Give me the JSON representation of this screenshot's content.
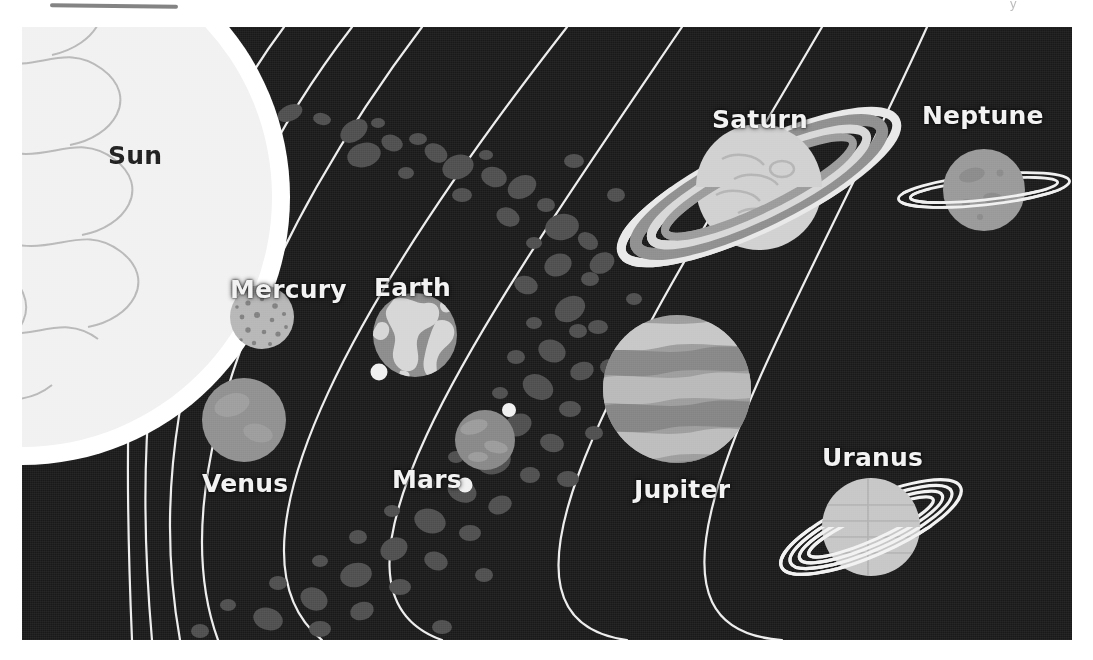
{
  "page": {
    "background_color": "#ffffff",
    "scan_artifact_text": "y"
  },
  "illustration": {
    "title": "Solar System",
    "background_color": "#191919",
    "orbit_line_color": "#ededed",
    "bounds": {
      "x": 22,
      "y": 27,
      "width": 1050,
      "height": 613
    }
  },
  "labels": {
    "sun": "Sun",
    "mercury": "Mercury",
    "venus": "Venus",
    "earth": "Earth",
    "mars": "Mars",
    "jupiter": "Jupiter",
    "saturn": "Saturn",
    "uranus": "Uranus",
    "neptune": "Neptune"
  },
  "bodies": [
    {
      "name": "sun",
      "label": "Sun",
      "order": 0,
      "kind": "star",
      "cx": 0,
      "cy": 170,
      "r": 250,
      "color": "#f0f0f0",
      "surface": "swirl-contours",
      "rings": 0,
      "moons": 0,
      "label_color": "#1d1d1d"
    },
    {
      "name": "mercury",
      "label": "Mercury",
      "order": 1,
      "kind": "planet",
      "cx": 240,
      "cy": 290,
      "r": 32,
      "color": "#b9b9b9",
      "surface": "craters",
      "rings": 0,
      "moons": 0,
      "label_color": "#f2f2f2"
    },
    {
      "name": "venus",
      "label": "Venus",
      "order": 2,
      "kind": "planet",
      "cx": 222,
      "cy": 393,
      "r": 42,
      "color": "#939393",
      "surface": "smooth",
      "rings": 0,
      "moons": 0,
      "label_color": "#f2f2f2"
    },
    {
      "name": "earth",
      "label": "Earth",
      "order": 3,
      "kind": "planet",
      "cx": 393,
      "cy": 308,
      "r": 42,
      "color": "#8e8e8e",
      "surface": "continents",
      "rings": 0,
      "moons": 1,
      "label_color": "#f2f2f2"
    },
    {
      "name": "mars",
      "label": "Mars",
      "order": 4,
      "kind": "planet",
      "cx": 463,
      "cy": 413,
      "r": 30,
      "color": "#8a8a8a",
      "surface": "mottled",
      "rings": 0,
      "moons": 2,
      "label_color": "#f2f2f2"
    },
    {
      "name": "jupiter",
      "label": "Jupiter",
      "order": 5,
      "kind": "planet",
      "cx": 655,
      "cy": 362,
      "r": 74,
      "color": "#a0a0a0",
      "surface": "cloud-bands",
      "rings": 0,
      "moons": 0,
      "label_color": "#f2f2f2"
    },
    {
      "name": "saturn",
      "label": "Saturn",
      "order": 6,
      "kind": "planet",
      "cx": 737,
      "cy": 160,
      "r": 63,
      "color": "#d2d2d2",
      "surface": "smooth-banded",
      "rings": 4,
      "moons": 0,
      "label_color": "#f2f2f2"
    },
    {
      "name": "uranus",
      "label": "Uranus",
      "order": 7,
      "kind": "planet",
      "cx": 849,
      "cy": 500,
      "r": 49,
      "color": "#c8c8c8",
      "surface": "faint-bands",
      "rings": 4,
      "moons": 0,
      "label_color": "#f2f2f2"
    },
    {
      "name": "neptune",
      "label": "Neptune",
      "order": 8,
      "kind": "planet",
      "cx": 962,
      "cy": 163,
      "r": 41,
      "color": "#9a9a9a",
      "surface": "speckled",
      "rings": 2,
      "moons": 0,
      "label_color": "#f2f2f2"
    }
  ],
  "asteroid_belt": {
    "name": "asteroid-belt",
    "description": "band of irregular rocks between Mars and Jupiter",
    "color": "#4a4a4a",
    "count": 72
  },
  "orbits": {
    "count": 8,
    "color": "#ededed",
    "stroke_width": 2
  }
}
